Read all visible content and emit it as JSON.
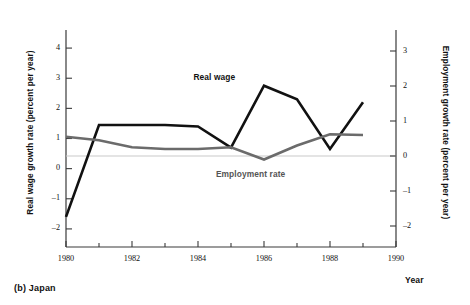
{
  "figure": {
    "caption": "(b) Japan"
  },
  "chart_data": {
    "type": "line",
    "title": "",
    "xlabel": "Year",
    "ylabel": "Real wage growth rate (percent per year)",
    "y2label": "Employment growth rate (percent per year)",
    "xlim": [
      1980,
      1990
    ],
    "ylim": [
      -2.6,
      4.6
    ],
    "y2lim": [
      -2.6,
      3.6
    ],
    "grid": false,
    "legend_position": "inline-annotations",
    "x": [
      1980,
      1981,
      1982,
      1983,
      1984,
      1985,
      1986,
      1987,
      1988,
      1989
    ],
    "xticks": [
      1980,
      1981,
      1982,
      1983,
      1984,
      1985,
      1986,
      1987,
      1988,
      1989,
      1990
    ],
    "xticklabels": [
      "1980",
      "",
      "1982",
      "",
      "1984",
      "",
      "1986",
      "",
      "1988",
      "",
      "1990"
    ],
    "yticks_left": [
      4,
      3,
      2,
      1,
      0,
      -1,
      -2
    ],
    "yticklabels_left": [
      "4",
      "3",
      "2",
      "1",
      "0",
      "-1",
      "-2"
    ],
    "yticks_right": [
      3,
      2,
      1,
      0,
      -1,
      -2
    ],
    "yticklabels_right": [
      "3",
      "2",
      "1",
      "0",
      "-1",
      "-2"
    ],
    "series": [
      {
        "name": "Real wage",
        "axis": "left",
        "color": "#111111",
        "width": 2.6,
        "values": [
          -1.6,
          1.45,
          1.45,
          1.45,
          1.4,
          0.7,
          2.75,
          2.3,
          0.65,
          2.2
        ]
      },
      {
        "name": "Employment rate",
        "axis": "right",
        "color": "#6b6b6b",
        "width": 2.6,
        "values": [
          0.55,
          0.45,
          0.25,
          0.2,
          0.2,
          0.25,
          -0.1,
          0.3,
          0.62,
          0.6
        ]
      }
    ],
    "annotations": [
      {
        "text": "Real wage",
        "x": 1985.8,
        "y": 3.0
      },
      {
        "text": "Employment rate",
        "x": 1986.3,
        "y": -0.55
      }
    ]
  }
}
